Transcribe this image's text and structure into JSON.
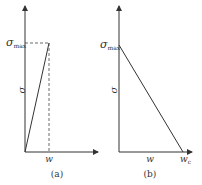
{
  "panels": [
    {
      "label": "(a)",
      "y_label": "σ",
      "x_label": "w",
      "y_mark": "σ",
      "y_mark_sub": "max",
      "shape": "linear rise to σmax at w"
    },
    {
      "label": "(b)",
      "y_label": "σ",
      "x_label": "w",
      "y_mark": "σ",
      "y_mark_sub": "max",
      "x_end_label": "w",
      "x_end_sub": "c",
      "shape": "linear softening from σmax to zero at wc"
    }
  ],
  "colors": {
    "line": "#333333",
    "axis": "#333333",
    "dashed": "#444444"
  }
}
